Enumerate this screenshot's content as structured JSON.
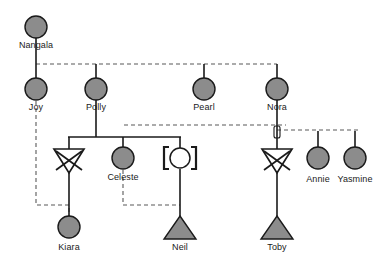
{
  "diagram": {
    "type": "genogram",
    "canvas": {
      "width": 387,
      "height": 267
    },
    "colors": {
      "background": "#ffffff",
      "symbol_fill": "#8c8c8c",
      "symbol_stroke": "#1a1a1a",
      "line_solid": "#1a1a1a",
      "line_dashed": "#6e6e6e",
      "label_text": "#1a1a1a",
      "unfilled": "#ffffff"
    }
  },
  "people": [
    {
      "id": "nangala",
      "label": "Nangala",
      "symbol": "female-circle-filled",
      "x": 36,
      "y": 27,
      "radius": 11,
      "label_x": 36,
      "label_y": 40
    },
    {
      "id": "joy",
      "label": "Joy",
      "symbol": "female-circle-filled",
      "x": 36,
      "y": 89,
      "radius": 11,
      "label_x": 36,
      "label_y": 102
    },
    {
      "id": "polly",
      "label": "Polly",
      "symbol": "female-circle-filled",
      "x": 96,
      "y": 89,
      "radius": 11,
      "label_x": 96,
      "label_y": 102
    },
    {
      "id": "pearl",
      "label": "Pearl",
      "symbol": "female-circle-filled",
      "x": 204,
      "y": 89,
      "radius": 11,
      "label_x": 204,
      "label_y": 102
    },
    {
      "id": "nora",
      "label": "Nora",
      "symbol": "female-circle-filled",
      "x": 277,
      "y": 89,
      "radius": 11,
      "label_x": 277,
      "label_y": 102
    },
    {
      "id": "pregnancy-loss-left",
      "label": "",
      "symbol": "inverted-triangle-crossed",
      "x": 69,
      "y": 160,
      "size": 15,
      "label_x": 69,
      "label_y": 176
    },
    {
      "id": "celeste",
      "label": "Celeste",
      "symbol": "female-circle-filled",
      "x": 123,
      "y": 158,
      "radius": 11,
      "label_x": 123,
      "label_y": 176
    },
    {
      "id": "adopted-female",
      "label": "",
      "symbol": "circle-in-brackets",
      "x": 180,
      "y": 158,
      "radius": 10,
      "label_x": 180,
      "label_y": 176
    },
    {
      "id": "pregnancy-loss-right",
      "label": "",
      "symbol": "inverted-triangle-crossed",
      "x": 277,
      "y": 160,
      "size": 15,
      "label_x": 277,
      "label_y": 176
    },
    {
      "id": "annie",
      "label": "Annie",
      "symbol": "female-circle-filled",
      "x": 318,
      "y": 158,
      "radius": 11,
      "label_x": 318,
      "label_y": 179
    },
    {
      "id": "yasmine",
      "label": "Yasmine",
      "symbol": "female-circle-filled",
      "x": 355,
      "y": 158,
      "radius": 11,
      "label_x": 355,
      "label_y": 179
    },
    {
      "id": "kiara",
      "label": "Kiara",
      "symbol": "female-circle-filled",
      "x": 69,
      "y": 227,
      "radius": 11,
      "label_x": 69,
      "label_y": 247
    },
    {
      "id": "neil",
      "label": "Neil",
      "symbol": "pregnancy-triangle-filled",
      "x": 180,
      "y": 229,
      "size": 15,
      "label_x": 180,
      "label_y": 247
    },
    {
      "id": "toby",
      "label": "Toby",
      "symbol": "pregnancy-triangle-filled",
      "x": 277,
      "y": 229,
      "size": 15,
      "label_x": 277,
      "label_y": 247
    }
  ],
  "connections": {
    "solid": [
      {
        "name": "nangala-descent",
        "points": "36,38 36,64"
      },
      {
        "name": "joy-riser",
        "points": "36,64 36,78"
      },
      {
        "name": "polly-riser",
        "points": "96,64 96,78"
      },
      {
        "name": "pearl-riser",
        "points": "204,64 204,78"
      },
      {
        "name": "nora-riser",
        "points": "277,64 277,78"
      },
      {
        "name": "polly-descent",
        "points": "96,100 96,137"
      },
      {
        "name": "polly-children-bar",
        "points": "69,137 180,137"
      },
      {
        "name": "loss-left-riser",
        "points": "69,137 69,151"
      },
      {
        "name": "celeste-riser",
        "points": "123,137 123,147"
      },
      {
        "name": "adopted-riser",
        "points": "180,137 180,148"
      },
      {
        "name": "kiara-riser",
        "points": "69,170 69,216"
      },
      {
        "name": "adopted-to-neil",
        "points": "180,168 180,216"
      },
      {
        "name": "nora-descent",
        "points": "277,100 277,151"
      },
      {
        "name": "loss-right-to-toby",
        "points": "277,170 277,216"
      },
      {
        "name": "annie-riser",
        "points": "318,137 318,147"
      },
      {
        "name": "yasmine-riser",
        "points": "355,137 355,147"
      }
    ],
    "dashed": [
      {
        "name": "nangala-sibling-bar",
        "points": "36,64 277,64"
      },
      {
        "name": "joy-to-kiara",
        "points": "36,100 36,205 69,205 69,216"
      },
      {
        "name": "celeste-to-neil",
        "points": "123,170 123,205 180,205"
      },
      {
        "name": "polly-right-branch",
        "points": "123,124 286,124"
      },
      {
        "name": "polly-left-branch",
        "points": "123,124 123,137"
      },
      {
        "name": "nora-right-bar",
        "points": "277,130 360,130 360,137"
      },
      {
        "name": "nora-right-bar-2",
        "points": "318,130 318,137"
      },
      {
        "name": "lower-left-dashed",
        "points": "36,137 69,137"
      }
    ]
  }
}
